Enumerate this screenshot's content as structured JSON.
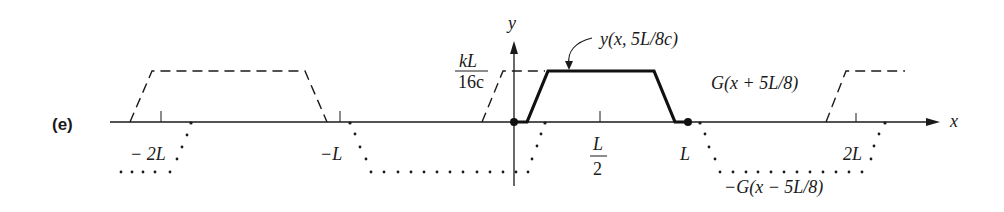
{
  "panel_label": "(e)",
  "axes": {
    "x_label": "x",
    "y_label": "y",
    "x_ticks": [
      {
        "label": "− 2L",
        "x": 161
      },
      {
        "label": "−L",
        "x": 340
      },
      {
        "label_num": "L",
        "label_den": "2",
        "x": 600
      },
      {
        "label": "L",
        "x": 687
      },
      {
        "label": "2L",
        "x": 857
      }
    ],
    "y_level_label": {
      "num": "kL",
      "den": "16c"
    }
  },
  "curves": {
    "solid": {
      "label": "y(x, 5L/8c)",
      "style": "solid-bold"
    },
    "dashed": {
      "label": "G(x + 5L/8)",
      "style": "dashed"
    },
    "dotted": {
      "label": "−G(x − 5L/8)",
      "style": "dotted"
    }
  },
  "colors": {
    "ink": "#1a1a1a",
    "background": "#ffffff"
  }
}
